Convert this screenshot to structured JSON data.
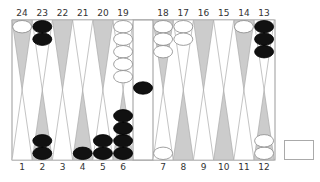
{
  "game": "backgammon",
  "board": {
    "colors": {
      "point_dark": "#cccccc",
      "point_light": "#ffffff",
      "border": "#999999",
      "checker_black": "#111111",
      "checker_white": "#ffffff"
    },
    "top_labels": [
      "24",
      "23",
      "22",
      "21",
      "20",
      "19",
      "18",
      "17",
      "16",
      "15",
      "14",
      "13"
    ],
    "bottom_labels": [
      "1",
      "2",
      "3",
      "4",
      "5",
      "6",
      "7",
      "8",
      "9",
      "10",
      "11",
      "12"
    ],
    "points": [
      {
        "point": 1,
        "color": "",
        "count": 0
      },
      {
        "point": 2,
        "color": "black",
        "count": 2
      },
      {
        "point": 3,
        "color": "",
        "count": 0
      },
      {
        "point": 4,
        "color": "black",
        "count": 1
      },
      {
        "point": 5,
        "color": "black",
        "count": 2
      },
      {
        "point": 6,
        "color": "black",
        "count": 4
      },
      {
        "point": 7,
        "color": "white",
        "count": 1
      },
      {
        "point": 8,
        "color": "",
        "count": 0
      },
      {
        "point": 9,
        "color": "",
        "count": 0
      },
      {
        "point": 10,
        "color": "",
        "count": 0
      },
      {
        "point": 11,
        "color": "",
        "count": 0
      },
      {
        "point": 12,
        "color": "white",
        "count": 2
      },
      {
        "point": 13,
        "color": "black",
        "count": 3
      },
      {
        "point": 14,
        "color": "white",
        "count": 1
      },
      {
        "point": 15,
        "color": "",
        "count": 0
      },
      {
        "point": 16,
        "color": "",
        "count": 0
      },
      {
        "point": 17,
        "color": "white",
        "count": 2
      },
      {
        "point": 18,
        "color": "white",
        "count": 3
      },
      {
        "point": 19,
        "color": "white",
        "count": 5
      },
      {
        "point": 20,
        "color": "",
        "count": 0
      },
      {
        "point": 21,
        "color": "",
        "count": 0
      },
      {
        "point": 22,
        "color": "",
        "count": 0
      },
      {
        "point": 23,
        "color": "black",
        "count": 2
      },
      {
        "point": 24,
        "color": "white",
        "count": 1
      }
    ],
    "bar": {
      "black": 1,
      "white": 0
    },
    "doubling_cube": {
      "value": ""
    }
  }
}
